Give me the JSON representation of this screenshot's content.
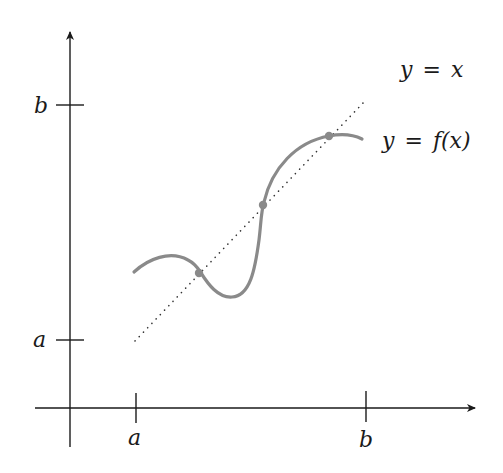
{
  "diagram": {
    "axes": {
      "x_ticks": [
        {
          "label": "a",
          "x": 135
        },
        {
          "label": "b",
          "x": 366
        }
      ],
      "y_ticks": [
        {
          "label": "b",
          "y": 105
        },
        {
          "label": "a",
          "y": 340
        }
      ]
    },
    "curves": {
      "identity": {
        "label_lhs": "y",
        "label_eq": "=",
        "label_rhs": "x",
        "style": "dotted",
        "color": "#333333"
      },
      "function": {
        "label_lhs": "y",
        "label_eq": "=",
        "label_rhs": "f(x)",
        "style": "solid",
        "color": "#8a8a8a"
      }
    },
    "fixed_points": [
      {
        "x": 199,
        "y": 273
      },
      {
        "x": 263,
        "y": 205
      },
      {
        "x": 329,
        "y": 136
      }
    ],
    "colors": {
      "axis": "#1a1a1a",
      "curve": "#8a8a8a",
      "point": "#8a8a8a",
      "dotted": "#333333"
    }
  }
}
